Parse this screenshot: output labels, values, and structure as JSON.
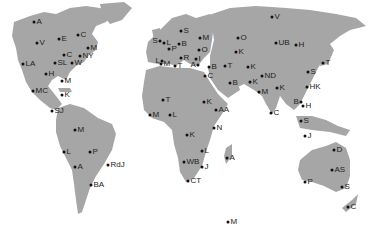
{
  "map": {
    "land_color": "#a6a6a6",
    "background_color": "#ffffff",
    "dot_color": "#111111",
    "label_color": "#222222"
  },
  "regions": [
    {
      "name": "north-america",
      "cities": [
        {
          "label": "A",
          "x": 34,
          "y": 19
        },
        {
          "label": "V",
          "x": 37,
          "y": 40
        },
        {
          "label": "E",
          "x": 59,
          "y": 36
        },
        {
          "label": "C",
          "x": 78,
          "y": 32
        },
        {
          "label": "M",
          "x": 88,
          "y": 45
        },
        {
          "label": "C",
          "x": 64,
          "y": 52
        },
        {
          "label": "NY",
          "x": 80,
          "y": 53
        },
        {
          "label": "W",
          "x": 72,
          "y": 60
        },
        {
          "label": "LA",
          "x": 23,
          "y": 61
        },
        {
          "label": "SL",
          "x": 55,
          "y": 60
        },
        {
          "label": "H",
          "x": 46,
          "y": 71
        },
        {
          "label": "M",
          "x": 62,
          "y": 78
        },
        {
          "label": "MC",
          "x": 33,
          "y": 88
        },
        {
          "label": "K",
          "x": 62,
          "y": 92
        },
        {
          "label": "SJ",
          "x": 52,
          "y": 108
        }
      ]
    },
    {
      "name": "south-america",
      "cities": [
        {
          "label": "M",
          "x": 75,
          "y": 127
        },
        {
          "label": "L",
          "x": 64,
          "y": 149
        },
        {
          "label": "P",
          "x": 90,
          "y": 149
        },
        {
          "label": "A",
          "x": 75,
          "y": 164
        },
        {
          "label": "RdJ",
          "x": 108,
          "y": 162
        },
        {
          "label": "BA",
          "x": 91,
          "y": 182
        }
      ]
    },
    {
      "name": "europe",
      "cities": [
        {
          "label": "S",
          "x": 181,
          "y": 28
        },
        {
          "label": "M",
          "x": 200,
          "y": 35
        },
        {
          "label": "S",
          "x": 156,
          "y": 38
        },
        {
          "label": "L",
          "x": 164,
          "y": 40
        },
        {
          "label": "B",
          "x": 179,
          "y": 41
        },
        {
          "label": "P",
          "x": 169,
          "y": 46
        },
        {
          "label": "O",
          "x": 199,
          "y": 47
        },
        {
          "label": "R",
          "x": 181,
          "y": 55
        },
        {
          "label": "L",
          "x": 151,
          "y": 57
        },
        {
          "label": "M",
          "x": 160,
          "y": 60
        },
        {
          "label": "T",
          "x": 174,
          "y": 63
        },
        {
          "label": "A",
          "x": 195,
          "y": 62
        },
        {
          "label": "I",
          "x": 196,
          "y": 55
        }
      ]
    },
    {
      "name": "middle-east-asia",
      "cities": [
        {
          "label": "O",
          "x": 238,
          "y": 35
        },
        {
          "label": "K",
          "x": 236,
          "y": 49
        },
        {
          "label": "B",
          "x": 209,
          "y": 64
        },
        {
          "label": "C",
          "x": 205,
          "y": 73
        },
        {
          "label": "T",
          "x": 225,
          "y": 62
        },
        {
          "label": "B",
          "x": 230,
          "y": 80
        },
        {
          "label": "K",
          "x": 248,
          "y": 64
        },
        {
          "label": "K",
          "x": 250,
          "y": 79
        },
        {
          "label": "ND",
          "x": 262,
          "y": 73
        },
        {
          "label": "M",
          "x": 259,
          "y": 89
        },
        {
          "label": "K",
          "x": 277,
          "y": 85
        },
        {
          "label": "C",
          "x": 271,
          "y": 110
        },
        {
          "label": "V",
          "x": 272,
          "y": 14
        },
        {
          "label": "UB",
          "x": 276,
          "y": 40
        },
        {
          "label": "H",
          "x": 296,
          "y": 42
        },
        {
          "label": "T",
          "x": 323,
          "y": 60
        },
        {
          "label": "S",
          "x": 308,
          "y": 69
        },
        {
          "label": "HK",
          "x": 307,
          "y": 84
        },
        {
          "label": "B",
          "x": 296,
          "y": 99
        },
        {
          "label": "H",
          "x": 303,
          "y": 103
        },
        {
          "label": "S",
          "x": 301,
          "y": 118
        },
        {
          "label": "J",
          "x": 305,
          "y": 133
        }
      ]
    },
    {
      "name": "africa",
      "cities": [
        {
          "label": "T",
          "x": 163,
          "y": 97
        },
        {
          "label": "K",
          "x": 204,
          "y": 99
        },
        {
          "label": "AA",
          "x": 216,
          "y": 107
        },
        {
          "label": "M",
          "x": 150,
          "y": 112
        },
        {
          "label": "L",
          "x": 170,
          "y": 112
        },
        {
          "label": "K",
          "x": 187,
          "y": 132
        },
        {
          "label": "N",
          "x": 214,
          "y": 125
        },
        {
          "label": "L",
          "x": 202,
          "y": 148
        },
        {
          "label": "WB",
          "x": 184,
          "y": 159
        },
        {
          "label": "J",
          "x": 202,
          "y": 164
        },
        {
          "label": "A",
          "x": 227,
          "y": 155
        },
        {
          "label": "CT",
          "x": 188,
          "y": 178
        }
      ]
    },
    {
      "name": "oceania",
      "cities": [
        {
          "label": "D",
          "x": 334,
          "y": 147
        },
        {
          "label": "AS",
          "x": 332,
          "y": 167
        },
        {
          "label": "P",
          "x": 305,
          "y": 179
        },
        {
          "label": "S",
          "x": 342,
          "y": 184
        },
        {
          "label": "C",
          "x": 348,
          "y": 204
        }
      ]
    },
    {
      "name": "antarctica",
      "cities": [
        {
          "label": "M",
          "x": 228,
          "y": 219
        }
      ]
    }
  ]
}
